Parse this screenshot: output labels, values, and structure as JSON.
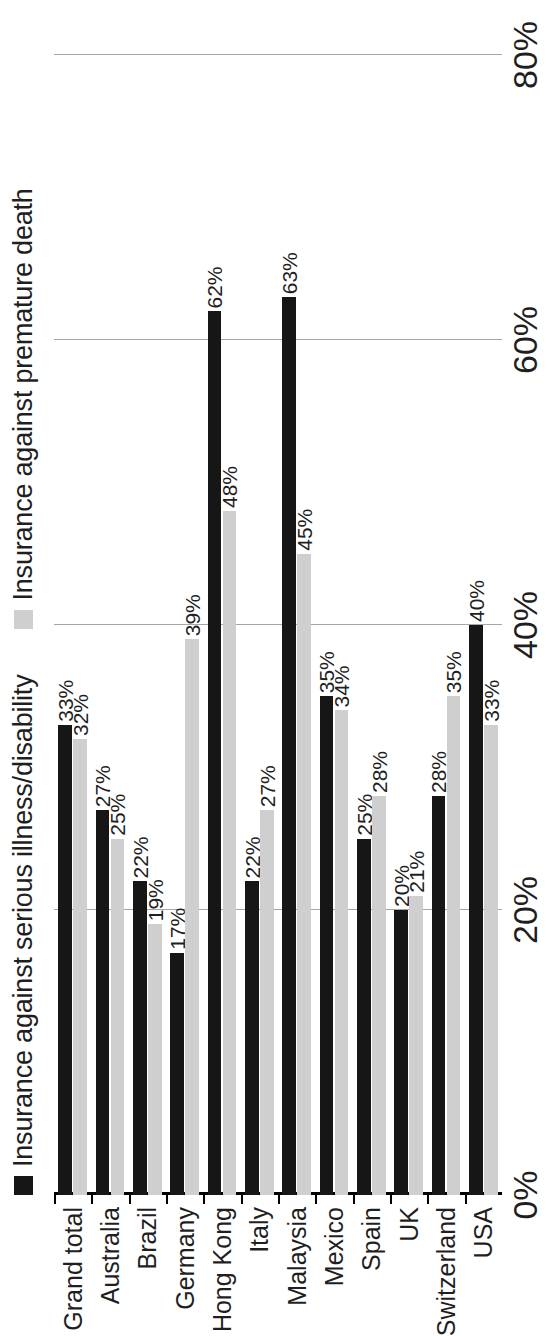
{
  "chart_data": {
    "type": "bar",
    "orientation": "horizontal",
    "title": "",
    "subtitle": "",
    "xlabel": "",
    "ylabel": "",
    "xlim": [
      0,
      80
    ],
    "grid": true,
    "legend_position": "top-left",
    "value_suffix": "%",
    "tick_labels": [
      "0%",
      "20%",
      "40%",
      "60%",
      "80%"
    ],
    "tick_values": [
      0,
      20,
      40,
      60,
      80
    ],
    "categories": [
      "Grand total",
      "Australia",
      "Brazil",
      "Germany",
      "Hong Kong",
      "Italy",
      "Malaysia",
      "Mexico",
      "Spain",
      "UK",
      "Switzerland",
      "USA"
    ],
    "series": [
      {
        "name": "Insurance against serious illness/disability",
        "color": "#161616",
        "values": [
          33,
          27,
          22,
          17,
          62,
          22,
          63,
          35,
          25,
          20,
          28,
          40
        ],
        "labels": [
          "33%",
          "27%",
          "22%",
          "17%",
          "62%",
          "22%",
          "63%",
          "35%",
          "25%",
          "20%",
          "28%",
          "40%"
        ]
      },
      {
        "name": "Insurance against premature death",
        "color": "#cfcfcf",
        "values": [
          32,
          25,
          19,
          39,
          48,
          27,
          45,
          34,
          28,
          21,
          35,
          33
        ],
        "labels": [
          "32%",
          "25%",
          "19%",
          "39%",
          "48%",
          "27%",
          "45%",
          "34%",
          "28%",
          "21%",
          "35%",
          "33%"
        ]
      }
    ]
  },
  "legend": {
    "items": [
      {
        "label": "Insurance against serious illness/disability",
        "swatch": "series-dark"
      },
      {
        "label": "Insurance against premature death",
        "swatch": "series-light"
      }
    ]
  },
  "colors": {
    "series_dark": "#161616",
    "series_light": "#cfcfcf",
    "gridline": "#a6a6a6",
    "axis": "#000000",
    "text": "#1f1f1f",
    "background": "#ffffff"
  }
}
